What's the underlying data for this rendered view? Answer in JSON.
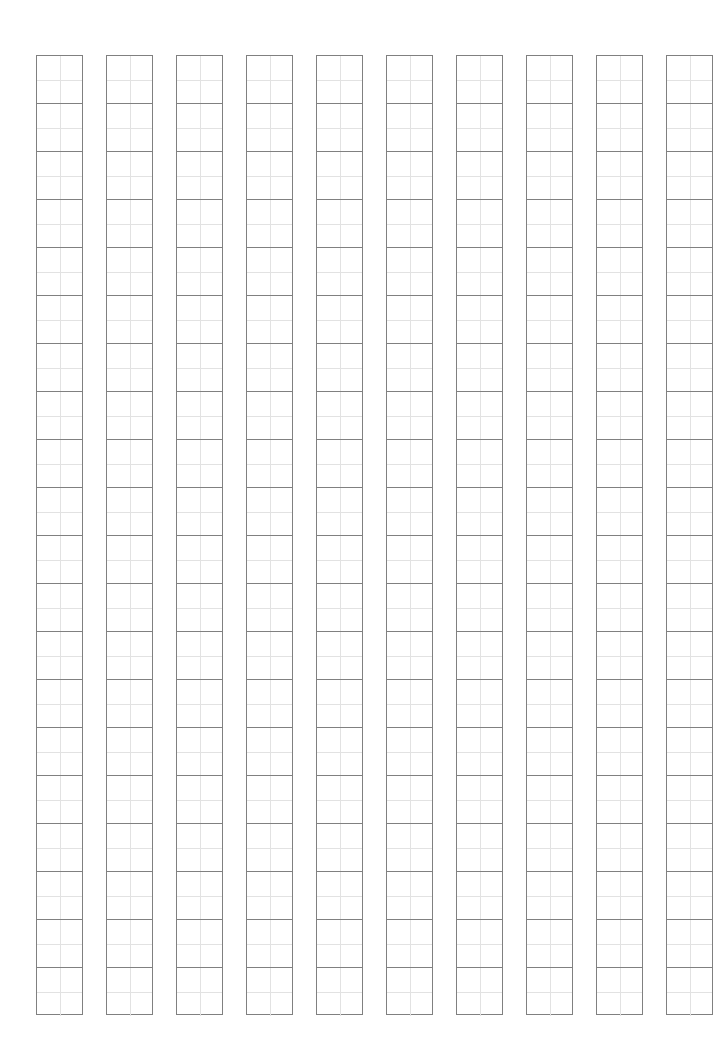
{
  "sheet": {
    "type": "character-practice-grid",
    "columns": 10,
    "rows_per_column": 20,
    "column_lefts": [
      36,
      106,
      176,
      246,
      316,
      386,
      456,
      526,
      596,
      666
    ],
    "column_width": 47,
    "cell_height": 48,
    "top": 55,
    "colors": {
      "border": "#808080",
      "guide": "#e2e2e2",
      "background": "#ffffff"
    }
  }
}
